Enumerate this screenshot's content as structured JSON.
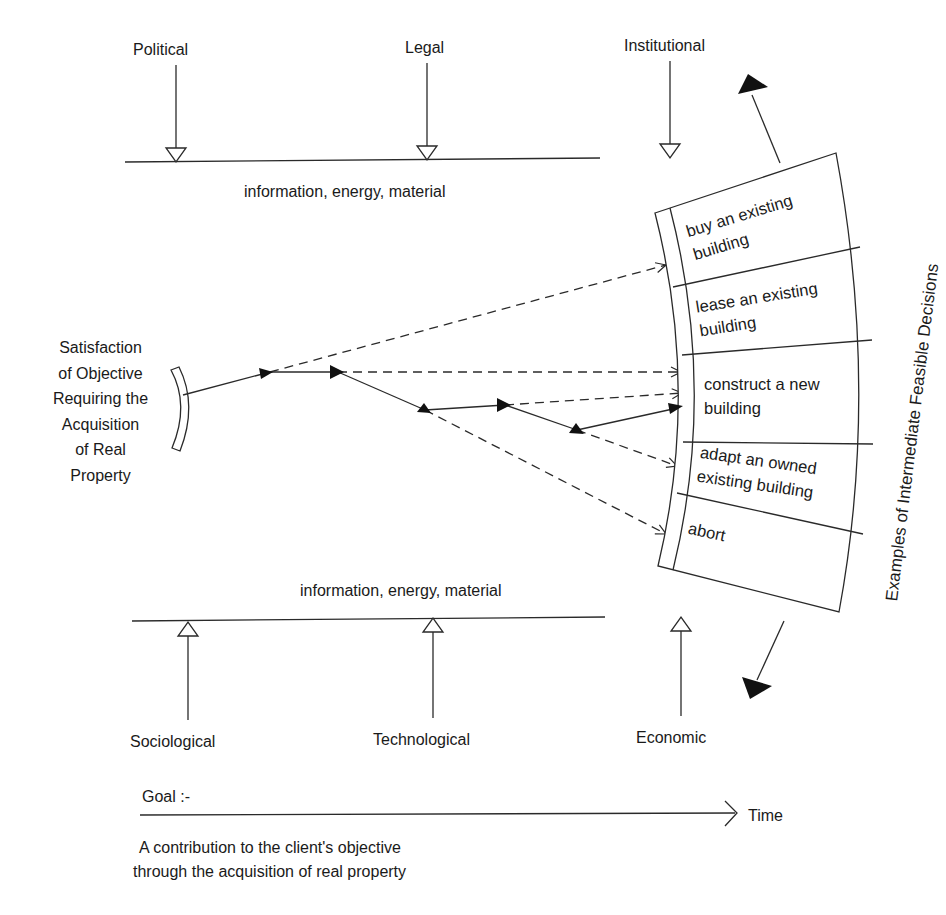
{
  "top_influences": {
    "labels": [
      "Political",
      "Legal",
      "Institutional"
    ],
    "flow_label": "information, energy, material"
  },
  "bottom_influences": {
    "labels": [
      "Sociological",
      "Technological",
      "Economic"
    ],
    "flow_label": "information, energy, material"
  },
  "origin": {
    "lines": [
      "Satisfaction",
      "of Objective",
      "Requiring the",
      "Acquisition",
      "of Real",
      "Property"
    ]
  },
  "decisions": {
    "title": "Examples of Intermediate Feasible Decisions",
    "options": [
      {
        "line1": "buy an existing",
        "line2": "building"
      },
      {
        "line1": "lease an existing",
        "line2": "building"
      },
      {
        "line1": "construct a new",
        "line2": "building"
      },
      {
        "line1": "adapt an owned",
        "line2": "existing building"
      },
      {
        "line1": "abort",
        "line2": ""
      }
    ]
  },
  "timeline": {
    "goal_label": "Goal :-",
    "axis_label": "Time",
    "goal_text_line1": "A contribution to the client's objective",
    "goal_text_line2": "through the acquisition of real property"
  },
  "colors": {
    "stroke": "#2a2a2a",
    "fill": "#111111",
    "background": "#ffffff"
  }
}
